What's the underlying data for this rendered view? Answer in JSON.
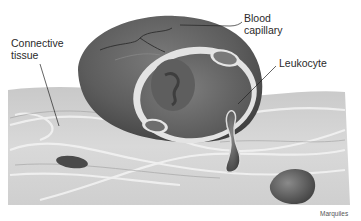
{
  "figure": {
    "labels": {
      "connective_tissue": "Connective\ntissue",
      "blood_capillary": "Blood\ncapillary",
      "leukocyte": "Leukocyte"
    },
    "credit": "Marquiles"
  },
  "colors": {
    "background": "#ffffff",
    "tissue_light": "#d6d6d6",
    "tissue_mid": "#bdbdbd",
    "capillary_wall": "#5a5a5a",
    "capillary_inner": "#6e6e6e",
    "capillary_lining": "#e4e4e4",
    "cell_dark": "#4a4a4a"
  }
}
